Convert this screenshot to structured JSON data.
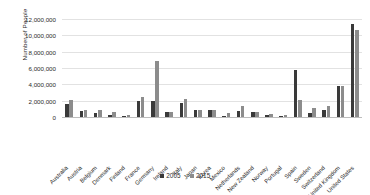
{
  "chart_data": {
    "type": "bar",
    "title": "",
    "xlabel": "",
    "ylabel": "Number of People",
    "ylim": [
      0,
      12000000
    ],
    "yticks": [
      "0",
      "2,000,000",
      "4,000,000",
      "6,000,000",
      "8,000,000",
      "10,000,000",
      "12,000,000"
    ],
    "ytick_values": [
      0,
      2000000,
      4000000,
      6000000,
      8000000,
      10000000,
      12000000
    ],
    "grid": true,
    "legend_position": "bottom",
    "categories": [
      "Australia",
      "Austria",
      "Belgium",
      "Denmark",
      "Finland",
      "France",
      "Germany",
      "Ireland",
      "Italy",
      "Japan",
      "Korea",
      "Mexico",
      "Netherlands",
      "New Zealand",
      "Norway",
      "Portugal",
      "Spain",
      "Sweden",
      "Switzerland",
      "United Kingdom",
      "United States"
    ],
    "series": [
      {
        "name": "2005",
        "color": "#3a3a3a",
        "values": [
          1550000,
          700000,
          450000,
          250000,
          120000,
          1900000,
          1900000,
          600000,
          1700000,
          900000,
          850000,
          120000,
          700000,
          600000,
          250000,
          130000,
          5750000,
          450000,
          800000,
          3750000,
          11350000
        ]
      },
      {
        "name": "2015",
        "color": "#8c8c8c",
        "values": [
          2100000,
          900000,
          900000,
          650000,
          200000,
          2450000,
          6900000,
          600000,
          2200000,
          900000,
          850000,
          450000,
          1300000,
          650000,
          350000,
          300000,
          2050000,
          1150000,
          1400000,
          3800000,
          10600000
        ]
      }
    ]
  },
  "legend": {
    "items": [
      {
        "label": "2005"
      },
      {
        "label": "2015"
      }
    ]
  }
}
